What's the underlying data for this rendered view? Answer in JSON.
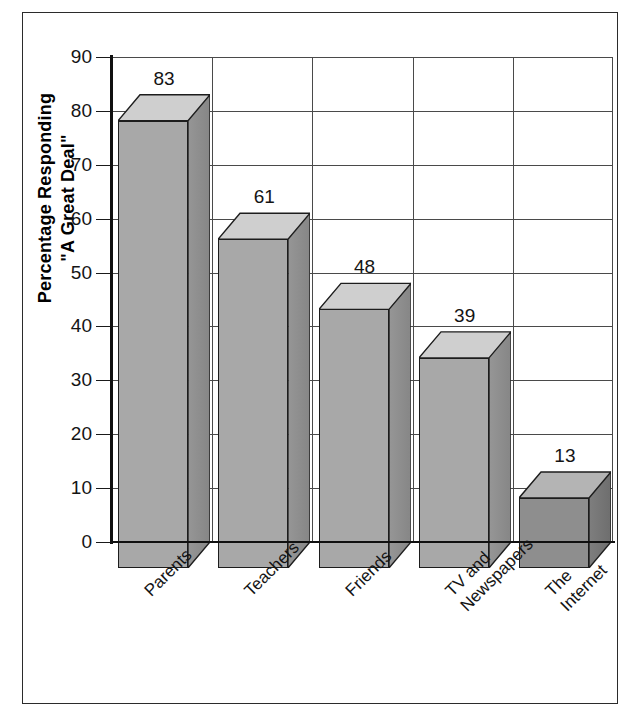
{
  "chart_data": {
    "type": "bar",
    "title": "",
    "subtitle": "",
    "xlabel": "",
    "ylabel": "Percentage Responding \"A Great Deal\"",
    "ylabel_lines": [
      "Percentage Responding",
      "\"A Great Deal\""
    ],
    "categories": [
      "Parents",
      "Teachers",
      "Friends",
      "TV and Newspapers",
      "The Internet"
    ],
    "category_lines": [
      [
        "Parents"
      ],
      [
        "Teachers"
      ],
      [
        "Friends"
      ],
      [
        "TV and",
        "Newspapers"
      ],
      [
        "The",
        "Internet"
      ]
    ],
    "values": [
      83,
      61,
      48,
      39,
      13
    ],
    "ylim": [
      0,
      90
    ],
    "ytick_step": 10,
    "yticks": [
      0,
      10,
      20,
      30,
      40,
      50,
      60,
      70,
      80,
      90
    ],
    "ytick_labels": [
      "0",
      "10",
      "20",
      "30",
      "40",
      "50",
      "60",
      "70",
      "80",
      "90"
    ],
    "value_labels": [
      "83",
      "61",
      "48",
      "39",
      "13"
    ],
    "grid": true,
    "grid_horizontal": true,
    "grid_vertical": true,
    "legend": false,
    "legend_position": "none",
    "style": "3d-column",
    "colors": {
      "bar_front": "#a8a8a8",
      "bar_top": "#cfcfcf",
      "bar_side": "#8d8d8d",
      "bar_front_dark": "#8e8e8e",
      "bar_top_dark": "#b4b4b4",
      "bar_side_dark": "#767676",
      "outline": "#1d1d1d",
      "axis": "#101010",
      "grid": "#4a4a4a",
      "text": "#141414",
      "background": "#ffffff",
      "frame": "#2b2b2b"
    },
    "series": [
      {
        "name": "Percentage Responding \"A Great Deal\"",
        "values": [
          83,
          61,
          48,
          39,
          13
        ]
      }
    ],
    "points": [
      {
        "category": "Parents",
        "value": 83,
        "shade": "light"
      },
      {
        "category": "Teachers",
        "value": 61,
        "shade": "light"
      },
      {
        "category": "Friends",
        "value": 48,
        "shade": "light"
      },
      {
        "category": "TV and Newspapers",
        "value": 39,
        "shade": "light"
      },
      {
        "category": "The Internet",
        "value": 13,
        "shade": "dark"
      }
    ]
  }
}
